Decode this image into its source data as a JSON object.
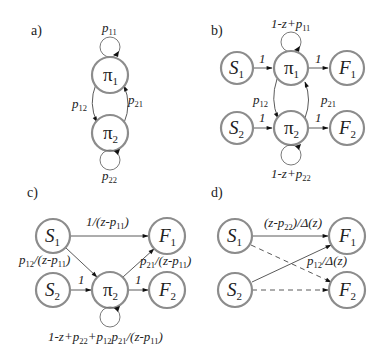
{
  "figure": {
    "panels": [
      {
        "id": "a",
        "label": "a)",
        "nodes": [
          {
            "id": "pi1",
            "symbol": "π",
            "sub": "1"
          },
          {
            "id": "pi2",
            "symbol": "π",
            "sub": "2"
          }
        ],
        "edges": [
          {
            "from": "pi1",
            "to": "pi1",
            "label": "p",
            "sub": "11",
            "style": "solid"
          },
          {
            "from": "pi1",
            "to": "pi2",
            "label": "p",
            "sub": "12",
            "style": "solid"
          },
          {
            "from": "pi2",
            "to": "pi1",
            "label": "p",
            "sub": "21",
            "style": "solid"
          },
          {
            "from": "pi2",
            "to": "pi2",
            "label": "p",
            "sub": "22",
            "style": "solid"
          }
        ]
      },
      {
        "id": "b",
        "label": "b)",
        "nodes": [
          {
            "id": "S1",
            "symbol": "S",
            "sub": "1"
          },
          {
            "id": "pi1",
            "symbol": "π",
            "sub": "1"
          },
          {
            "id": "F1",
            "symbol": "F",
            "sub": "1"
          },
          {
            "id": "S2",
            "symbol": "S",
            "sub": "2"
          },
          {
            "id": "pi2",
            "symbol": "π",
            "sub": "2"
          },
          {
            "id": "F2",
            "symbol": "F",
            "sub": "2"
          }
        ],
        "edges": [
          {
            "from": "S1",
            "to": "pi1",
            "label": "1"
          },
          {
            "from": "pi1",
            "to": "F1",
            "label": "1"
          },
          {
            "from": "S2",
            "to": "pi2",
            "label": "1"
          },
          {
            "from": "pi2",
            "to": "F2",
            "label": "1"
          },
          {
            "from": "pi1",
            "to": "pi1",
            "label_pre": "1-z+p",
            "sub": "11"
          },
          {
            "from": "pi2",
            "to": "pi2",
            "label_pre": "1-z+p",
            "sub": "22"
          },
          {
            "from": "pi1",
            "to": "pi2",
            "label": "p",
            "sub": "12"
          },
          {
            "from": "pi2",
            "to": "pi1",
            "label": "p",
            "sub": "21"
          }
        ],
        "text": {
          "one": "1",
          "loop1_pre": "1-z+p",
          "loop1_sub": "11",
          "loop2_pre": "1-z+p",
          "loop2_sub": "22"
        }
      },
      {
        "id": "c",
        "label": "c)",
        "nodes": [
          {
            "id": "S1",
            "symbol": "S",
            "sub": "1"
          },
          {
            "id": "F1",
            "symbol": "F",
            "sub": "1"
          },
          {
            "id": "S2",
            "symbol": "S",
            "sub": "2"
          },
          {
            "id": "pi2",
            "symbol": "π",
            "sub": "2"
          },
          {
            "id": "F2",
            "symbol": "F",
            "sub": "2"
          }
        ],
        "edges": [
          {
            "from": "S1",
            "to": "F1",
            "label": "1/(z-p11)"
          },
          {
            "from": "S1",
            "to": "pi2",
            "label": "p12/(z-p11)"
          },
          {
            "from": "pi2",
            "to": "F1",
            "label": "p21/(z-p11)"
          },
          {
            "from": "S2",
            "to": "pi2",
            "label": "1"
          },
          {
            "from": "pi2",
            "to": "F2",
            "label": "1"
          },
          {
            "from": "pi2",
            "to": "pi2",
            "label": "1-z+p22+p12p21/(z-p11)"
          }
        ]
      },
      {
        "id": "d",
        "label": "d)",
        "nodes": [
          {
            "id": "S1",
            "symbol": "S",
            "sub": "1"
          },
          {
            "id": "F1",
            "symbol": "F",
            "sub": "1"
          },
          {
            "id": "S2",
            "symbol": "S",
            "sub": "2"
          },
          {
            "id": "F2",
            "symbol": "F",
            "sub": "2"
          }
        ],
        "edges": [
          {
            "from": "S1",
            "to": "F1",
            "label": "(z-p22)/Δ(z)",
            "style": "solid"
          },
          {
            "from": "S2",
            "to": "F1",
            "label": "p12/Δ(z)",
            "style": "solid"
          },
          {
            "from": "S1",
            "to": "F2",
            "label": "",
            "style": "dashed"
          },
          {
            "from": "S2",
            "to": "F2",
            "label": "",
            "style": "dashed"
          }
        ]
      }
    ]
  },
  "labels": {
    "a": "a)",
    "b": "b)",
    "c": "c)",
    "d": "d)",
    "pi": "π",
    "S": "S",
    "F": "F",
    "n1": "1",
    "n2": "2",
    "p": "p",
    "s11": "11",
    "s12": "12",
    "s21": "21",
    "s22": "22",
    "one": "1",
    "oneMinusZplus": "1-z+",
    "c_top_pre": "1/(z-",
    "c_close": ")",
    "c_left_slash": "/(z-",
    "c_loop_pre": "1-z+",
    "plus": "+",
    "d_top_pre": "(z-",
    "d_top_post": ")/Δ(z)",
    "d_mid_post": "/Δ(z)"
  }
}
